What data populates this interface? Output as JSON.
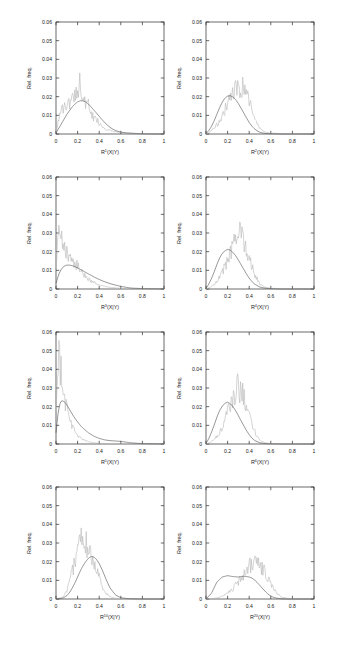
{
  "figure": {
    "axis": {
      "ylabel": "Rel. freq.",
      "y_ticks": [
        "0",
        "0.01",
        "0.02",
        "0.03",
        "0.04",
        "0.05",
        "0.06"
      ],
      "y_values": [
        0,
        0.01,
        0.02,
        0.03,
        0.04,
        0.05,
        0.06
      ],
      "ylim": [
        0,
        0.06
      ],
      "x_ticks": [
        "0",
        "0.2",
        "0.4",
        "0.6",
        "0.8",
        "1"
      ],
      "x_values": [
        0,
        0.2,
        0.4,
        0.6,
        0.8,
        1
      ],
      "xlim": [
        0,
        1
      ]
    },
    "colors": {
      "gray_curve": "#b9b9b9",
      "dark_curve": "#555555",
      "frame": "#2b2b2b",
      "background": "#ffffff"
    }
  },
  "chart_data": [
    {
      "type": "line",
      "panel": 1,
      "row": 1,
      "column": 1,
      "title": "",
      "xlabel": "R¹(X|Y)",
      "xlabel_base": "R",
      "xlabel_sup": "1",
      "xlabel_tail": "(X|Y)",
      "ylabel": "Rel. freq.",
      "xlim": [
        0,
        1
      ],
      "ylim": [
        0,
        0.06
      ],
      "grid": false,
      "legend": "none",
      "x": [
        0,
        0.025,
        0.05,
        0.075,
        0.1,
        0.125,
        0.15,
        0.175,
        0.2,
        0.225,
        0.25,
        0.275,
        0.3,
        0.325,
        0.35,
        0.375,
        0.4,
        0.425,
        0.45,
        0.475,
        0.5,
        0.525,
        0.55,
        0.575,
        0.6,
        0.65,
        0.7,
        0.75,
        0.8,
        0.9,
        1
      ],
      "series": [
        {
          "name": "noisy-gray",
          "values": [
            0.0005,
            0.0085,
            0.012,
            0.0135,
            0.0175,
            0.015,
            0.0195,
            0.0215,
            0.025,
            0.0285,
            0.0175,
            0.016,
            0.015,
            0.0105,
            0.0085,
            0.0075,
            0.006,
            0.0045,
            0.003,
            0.0022,
            0.002,
            0.0015,
            0.0012,
            0.001,
            0.0008,
            0.0005,
            0.0004,
            0.0003,
            0.0002,
            0.0001,
            0.0
          ]
        },
        {
          "name": "smooth-dark",
          "values": [
            0.0005,
            0.003,
            0.0055,
            0.008,
            0.0105,
            0.0125,
            0.0145,
            0.016,
            0.0172,
            0.0178,
            0.0178,
            0.0172,
            0.016,
            0.0145,
            0.0128,
            0.0112,
            0.0095,
            0.0078,
            0.0062,
            0.0048,
            0.0036,
            0.0026,
            0.0019,
            0.0014,
            0.001,
            0.0006,
            0.0004,
            0.0002,
            0.0001,
            0.0,
            0.0
          ]
        }
      ]
    },
    {
      "type": "line",
      "panel": 2,
      "row": 1,
      "column": 2,
      "title": "",
      "xlabel": "R²(X|Y)",
      "xlabel_base": "R",
      "xlabel_sup": "2",
      "xlabel_tail": "(X|Y)",
      "ylabel": "Rel. freq.",
      "xlim": [
        0,
        1
      ],
      "ylim": [
        0,
        0.06
      ],
      "grid": false,
      "legend": "none",
      "x": [
        0,
        0.025,
        0.05,
        0.075,
        0.1,
        0.125,
        0.15,
        0.175,
        0.2,
        0.225,
        0.25,
        0.275,
        0.3,
        0.325,
        0.35,
        0.375,
        0.4,
        0.425,
        0.45,
        0.475,
        0.5,
        0.525,
        0.55,
        0.6,
        0.65,
        0.7,
        0.8,
        0.9,
        1
      ],
      "series": [
        {
          "name": "noisy-gray",
          "values": [
            0.0,
            0.0008,
            0.0018,
            0.003,
            0.0048,
            0.007,
            0.0098,
            0.013,
            0.0165,
            0.0195,
            0.0215,
            0.024,
            0.0255,
            0.0235,
            0.025,
            0.0215,
            0.0175,
            0.013,
            0.0085,
            0.005,
            0.0028,
            0.0016,
            0.001,
            0.0005,
            0.0003,
            0.0002,
            0.0001,
            0.0,
            0.0
          ]
        },
        {
          "name": "smooth-dark",
          "values": [
            0.0002,
            0.0018,
            0.004,
            0.007,
            0.0105,
            0.014,
            0.017,
            0.0192,
            0.0203,
            0.0205,
            0.0198,
            0.0184,
            0.0163,
            0.0138,
            0.0112,
            0.0086,
            0.0062,
            0.0042,
            0.0027,
            0.0016,
            0.0009,
            0.0005,
            0.0003,
            0.0001,
            0.0001,
            0.0,
            0.0,
            0.0,
            0.0
          ]
        }
      ]
    },
    {
      "type": "line",
      "panel": 3,
      "row": 2,
      "column": 1,
      "title": "",
      "xlabel": "R³(X|Y)",
      "xlabel_base": "R",
      "xlabel_sup": "3",
      "xlabel_tail": "(X|Y)",
      "ylabel": "Rel. freq.",
      "xlim": [
        0,
        1
      ],
      "ylim": [
        0,
        0.06
      ],
      "grid": false,
      "legend": "none",
      "x": [
        0,
        0.025,
        0.05,
        0.075,
        0.1,
        0.125,
        0.15,
        0.175,
        0.2,
        0.225,
        0.25,
        0.275,
        0.3,
        0.325,
        0.35,
        0.4,
        0.45,
        0.5,
        0.55,
        0.6,
        0.65,
        0.7,
        0.8,
        0.9,
        1
      ],
      "series": [
        {
          "name": "noisy-gray",
          "values": [
            0.012,
            0.029,
            0.0255,
            0.0215,
            0.02,
            0.0185,
            0.016,
            0.014,
            0.012,
            0.01,
            0.0082,
            0.0068,
            0.0055,
            0.0044,
            0.0035,
            0.0022,
            0.0014,
            0.0009,
            0.0006,
            0.0004,
            0.0002,
            0.0001,
            0.0001,
            0.0,
            0.0
          ]
        },
        {
          "name": "smooth-dark",
          "values": [
            0.003,
            0.0078,
            0.0108,
            0.0122,
            0.0128,
            0.0128,
            0.0125,
            0.012,
            0.0113,
            0.0105,
            0.0097,
            0.0089,
            0.0081,
            0.0073,
            0.0065,
            0.0051,
            0.0039,
            0.0029,
            0.0021,
            0.0014,
            0.0009,
            0.0005,
            0.0002,
            0.0001,
            0.0
          ]
        }
      ]
    },
    {
      "type": "line",
      "panel": 4,
      "row": 2,
      "column": 2,
      "title": "",
      "xlabel": "R⁴(X|Y)",
      "xlabel_base": "R",
      "xlabel_sup": "4",
      "xlabel_tail": "(X|Y)",
      "ylabel": "Rel. freq.",
      "xlim": [
        0,
        1
      ],
      "ylim": [
        0,
        0.06
      ],
      "grid": false,
      "legend": "none",
      "x": [
        0,
        0.025,
        0.05,
        0.075,
        0.1,
        0.125,
        0.15,
        0.175,
        0.2,
        0.225,
        0.25,
        0.275,
        0.3,
        0.325,
        0.35,
        0.375,
        0.4,
        0.425,
        0.45,
        0.5,
        0.55,
        0.6,
        0.7,
        0.8,
        0.9,
        1
      ],
      "series": [
        {
          "name": "noisy-gray",
          "values": [
            0.0,
            0.0006,
            0.0014,
            0.0026,
            0.0042,
            0.0062,
            0.0088,
            0.012,
            0.0155,
            0.019,
            0.0225,
            0.0275,
            0.03,
            0.0285,
            0.0265,
            0.0225,
            0.0175,
            0.012,
            0.0075,
            0.0025,
            0.001,
            0.0004,
            0.0001,
            0.0,
            0.0,
            0.0
          ]
        },
        {
          "name": "smooth-dark",
          "values": [
            0.0003,
            0.0025,
            0.0055,
            0.009,
            0.013,
            0.0165,
            0.019,
            0.0205,
            0.0212,
            0.0208,
            0.0196,
            0.0178,
            0.0155,
            0.013,
            0.0105,
            0.008,
            0.0058,
            0.004,
            0.0026,
            0.001,
            0.0004,
            0.0002,
            0.0,
            0.0,
            0.0,
            0.0
          ]
        }
      ]
    },
    {
      "type": "line",
      "panel": 5,
      "row": 3,
      "column": 1,
      "title": "",
      "xlabel": "R⁵(X|Y)",
      "xlabel_base": "R",
      "xlabel_sup": "5",
      "xlabel_tail": "(X|Y)",
      "ylabel": "Rel. freq.",
      "xlim": [
        0,
        1
      ],
      "ylim": [
        0,
        0.06
      ],
      "grid": false,
      "legend": "none",
      "x": [
        0,
        0.02,
        0.04,
        0.06,
        0.08,
        0.1,
        0.125,
        0.15,
        0.175,
        0.2,
        0.225,
        0.25,
        0.3,
        0.35,
        0.4,
        0.45,
        0.5,
        0.55,
        0.6,
        0.65,
        0.7,
        0.8,
        0.9,
        1
      ],
      "series": [
        {
          "name": "noisy-gray",
          "values": [
            0.018,
            0.05,
            0.042,
            0.033,
            0.0255,
            0.0195,
            0.014,
            0.0098,
            0.0068,
            0.0048,
            0.0034,
            0.0024,
            0.0012,
            0.0007,
            0.0004,
            0.0003,
            0.0002,
            0.0001,
            0.0001,
            0.0,
            0.0,
            0.0,
            0.0,
            0.0
          ]
        },
        {
          "name": "smooth-dark",
          "values": [
            0.006,
            0.017,
            0.0225,
            0.0232,
            0.0225,
            0.021,
            0.0185,
            0.016,
            0.0138,
            0.0118,
            0.01,
            0.0085,
            0.006,
            0.0042,
            0.003,
            0.0022,
            0.0018,
            0.0016,
            0.0014,
            0.001,
            0.0006,
            0.0002,
            0.0001,
            0.0
          ]
        }
      ]
    },
    {
      "type": "line",
      "panel": 6,
      "row": 3,
      "column": 2,
      "title": "",
      "xlabel": "R⁶(X|Y)",
      "xlabel_base": "R",
      "xlabel_sup": "6",
      "xlabel_tail": "(X|Y)",
      "ylabel": "Rel. freq.",
      "xlim": [
        0,
        1
      ],
      "ylim": [
        0,
        0.06
      ],
      "grid": false,
      "legend": "none",
      "x": [
        0,
        0.025,
        0.05,
        0.075,
        0.1,
        0.125,
        0.15,
        0.175,
        0.2,
        0.225,
        0.25,
        0.275,
        0.3,
        0.325,
        0.35,
        0.375,
        0.4,
        0.425,
        0.45,
        0.5,
        0.55,
        0.6,
        0.7,
        0.8,
        0.9,
        1
      ],
      "series": [
        {
          "name": "noisy-gray",
          "values": [
            0.0,
            0.0005,
            0.0012,
            0.0024,
            0.004,
            0.0062,
            0.009,
            0.0125,
            0.0165,
            0.0205,
            0.025,
            0.029,
            0.0305,
            0.028,
            0.026,
            0.022,
            0.0165,
            0.011,
            0.0065,
            0.0018,
            0.0006,
            0.0002,
            0.0001,
            0.0,
            0.0,
            0.0
          ]
        },
        {
          "name": "smooth-dark",
          "values": [
            0.0003,
            0.0028,
            0.0062,
            0.01,
            0.0142,
            0.0178,
            0.0202,
            0.0218,
            0.0224,
            0.0216,
            0.02,
            0.0178,
            0.0152,
            0.0124,
            0.0098,
            0.0072,
            0.005,
            0.0032,
            0.0019,
            0.0006,
            0.0002,
            0.0001,
            0.0,
            0.0,
            0.0,
            0.0
          ]
        }
      ]
    },
    {
      "type": "line",
      "panel": 7,
      "row": 4,
      "column": 1,
      "title": "",
      "xlabel": "R¹⁰(X|Y)",
      "xlabel_base": "R",
      "xlabel_sup": "10",
      "xlabel_tail": "(X|Y)",
      "ylabel": "Rel. freq.",
      "xlim": [
        0,
        1
      ],
      "ylim": [
        0,
        0.06
      ],
      "grid": false,
      "legend": "none",
      "x": [
        0,
        0.05,
        0.075,
        0.1,
        0.125,
        0.15,
        0.175,
        0.2,
        0.225,
        0.25,
        0.275,
        0.3,
        0.325,
        0.35,
        0.375,
        0.4,
        0.425,
        0.45,
        0.475,
        0.5,
        0.55,
        0.6,
        0.65,
        0.7,
        0.8,
        0.9,
        1
      ],
      "series": [
        {
          "name": "noisy-gray",
          "values": [
            0.0,
            0.0008,
            0.002,
            0.0045,
            0.0085,
            0.014,
            0.0205,
            0.027,
            0.033,
            0.0345,
            0.03,
            0.0265,
            0.023,
            0.019,
            0.0155,
            0.0115,
            0.0075,
            0.0045,
            0.0024,
            0.0012,
            0.0004,
            0.0002,
            0.0001,
            0.0,
            0.0,
            0.0,
            0.0
          ]
        },
        {
          "name": "smooth-dark",
          "values": [
            0.0,
            0.0003,
            0.0008,
            0.0018,
            0.0035,
            0.0058,
            0.0086,
            0.0118,
            0.015,
            0.0178,
            0.02,
            0.0218,
            0.0228,
            0.0225,
            0.0212,
            0.019,
            0.016,
            0.0125,
            0.009,
            0.006,
            0.0022,
            0.0007,
            0.0003,
            0.0001,
            0.0,
            0.0,
            0.0
          ]
        }
      ]
    },
    {
      "type": "line",
      "panel": 8,
      "row": 4,
      "column": 2,
      "title": "",
      "xlabel": "R²⁰(X|Y)",
      "xlabel_base": "R",
      "xlabel_sup": "20",
      "xlabel_tail": "(X|Y)",
      "ylabel": "Rel. freq.",
      "xlim": [
        0,
        1
      ],
      "ylim": [
        0,
        0.06
      ],
      "grid": false,
      "legend": "none",
      "x": [
        0,
        0.05,
        0.1,
        0.15,
        0.2,
        0.25,
        0.3,
        0.325,
        0.35,
        0.375,
        0.4,
        0.425,
        0.45,
        0.475,
        0.5,
        0.525,
        0.55,
        0.575,
        0.6,
        0.625,
        0.65,
        0.7,
        0.75,
        0.8,
        0.9,
        1
      ],
      "series": [
        {
          "name": "noisy-gray",
          "values": [
            0.0,
            0.0002,
            0.0006,
            0.0014,
            0.003,
            0.0055,
            0.0095,
            0.0115,
            0.0135,
            0.016,
            0.018,
            0.0188,
            0.0192,
            0.0185,
            0.017,
            0.016,
            0.014,
            0.0115,
            0.0085,
            0.0055,
            0.0032,
            0.001,
            0.0004,
            0.0002,
            0.0,
            0.0
          ]
        },
        {
          "name": "smooth-dark",
          "values": [
            0.0,
            0.003,
            0.009,
            0.0118,
            0.0125,
            0.012,
            0.0118,
            0.012,
            0.0122,
            0.012,
            0.0118,
            0.0112,
            0.0102,
            0.0088,
            0.0072,
            0.0055,
            0.004,
            0.0026,
            0.0016,
            0.0009,
            0.0005,
            0.0001,
            0.0,
            0.0,
            0.0,
            0.0
          ]
        }
      ]
    }
  ]
}
